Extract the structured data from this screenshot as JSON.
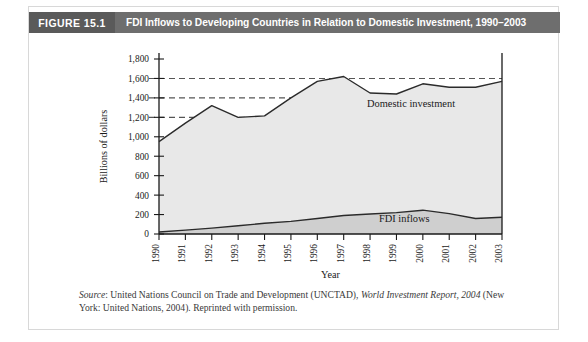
{
  "figure": {
    "number_label": "FIGURE 15.1",
    "title": "FDI Inflows to Developing Countries in Relation to Domestic Investment, 1990–2003",
    "header_bg": "#6e6e6e",
    "number_bg": "#5a5a5a"
  },
  "source": {
    "prefix": "Source",
    "text_before_italic": ": United Nations Council on Trade and Development (UNCTAD), ",
    "italic_title": "World Investment Report, 2004",
    "text_after_italic": " (New York: United Nations, 2004). Reprinted with permission."
  },
  "chart_data": {
    "type": "area",
    "title": "FDI Inflows to Developing Countries in Relation to Domestic Investment, 1990–2003",
    "xlabel": "Year",
    "ylabel": "Billions of dollars",
    "x": [
      1990,
      1991,
      1992,
      1993,
      1994,
      1995,
      1996,
      1997,
      1998,
      1999,
      2000,
      2001,
      2002,
      2003
    ],
    "categories": [
      "1990",
      "1991",
      "1992",
      "1993",
      "1994",
      "1995",
      "1996",
      "1997",
      "1998",
      "1999",
      "2000",
      "2001",
      "2002",
      "2003"
    ],
    "ylim": [
      0,
      1800
    ],
    "yticks": [
      0,
      200,
      400,
      600,
      800,
      1000,
      1200,
      1400,
      1600,
      1800
    ],
    "ytick_labels": [
      "0",
      "200",
      "400",
      "600",
      "800",
      "1,000",
      "1,200",
      "1,400",
      "1,600",
      "1,800"
    ],
    "grid": "horizontal-dashed-above-1200",
    "gridlines": [
      1200,
      1400,
      1600
    ],
    "legend": "inline-annotations",
    "series": [
      {
        "name": "Domestic investment",
        "annotation": "Domestic investment",
        "fill": "#e8e8e8",
        "line": "#2b2b2b",
        "values": [
          950,
          1140,
          1320,
          1200,
          1215,
          1400,
          1570,
          1620,
          1450,
          1440,
          1545,
          1510,
          1510,
          1570
        ]
      },
      {
        "name": "FDI inflows",
        "annotation": "FDI inflows",
        "fill": "#cfcfcf",
        "line": "#2b2b2b",
        "values": [
          20,
          40,
          60,
          85,
          110,
          130,
          160,
          190,
          205,
          220,
          245,
          210,
          160,
          172
        ]
      }
    ]
  }
}
